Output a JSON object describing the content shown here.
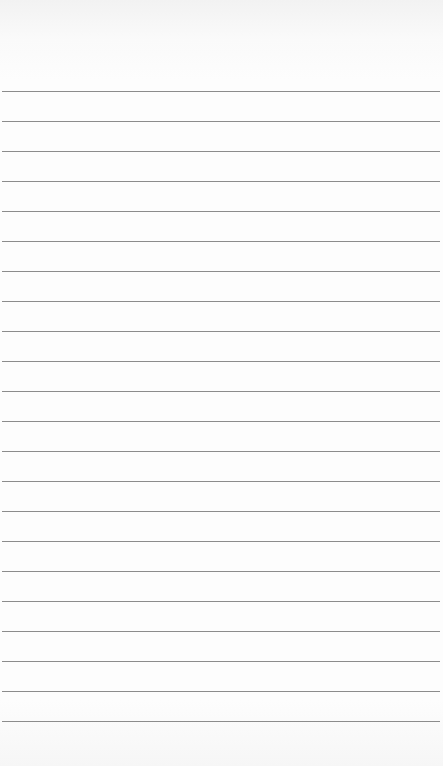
{
  "paper": {
    "type": "lined-notepad",
    "background_color": "#fdfdfd",
    "rule_color": "#8c8c8c",
    "first_rule_y": 91,
    "rule_spacing": 30,
    "rule_count": 22
  }
}
